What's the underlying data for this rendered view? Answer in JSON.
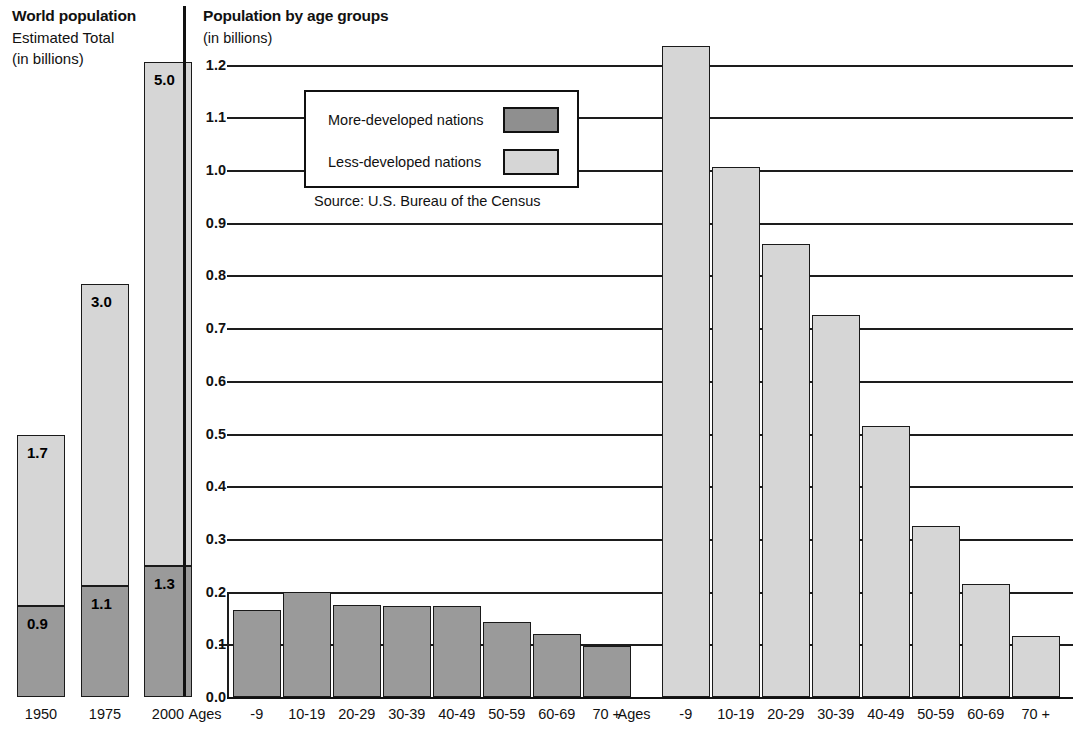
{
  "left": {
    "title": "World population",
    "subtitle_line1": "Estimated Total",
    "subtitle_line2": "(in billions)",
    "categories": [
      "1950",
      "1975",
      "2000"
    ],
    "segments": [
      {
        "year": "1950",
        "more_developed": 0.9,
        "less_developed": 1.7,
        "more_label": "0.9",
        "less_label": "1.7"
      },
      {
        "year": "1975",
        "more_developed": 1.1,
        "less_developed": 3.0,
        "more_label": "1.1",
        "less_label": "3.0"
      },
      {
        "year": "2000",
        "more_developed": 1.3,
        "less_developed": 5.0,
        "more_label": "1.3",
        "less_label": "5.0"
      }
    ]
  },
  "right": {
    "title": "Population by age groups",
    "subtitle": "(in billions)",
    "ages_label": "Ages",
    "legend": {
      "more_developed": "More-developed nations",
      "less_developed": "Less-developed nations"
    },
    "source": "Source: U.S. Bureau of the Census",
    "yticks": [
      "0.0",
      "0.1",
      "0.2",
      "0.3",
      "0.4",
      "0.5",
      "0.6",
      "0.7",
      "0.8",
      "0.9",
      "1.0",
      "1.1",
      "1.2"
    ],
    "age_groups": [
      "-9",
      "10-19",
      "20-29",
      "30-39",
      "40-49",
      "50-59",
      "60-69",
      "70 +"
    ]
  },
  "colors": {
    "more_developed": "#9a9a9a",
    "less_developed": "#d6d6d6",
    "outline": "#1a1a1a",
    "background": "#ffffff"
  },
  "chart_data": {
    "type": "bar",
    "title": "Population by age groups",
    "subtitle": "(in billions)",
    "xlabel": "Ages",
    "ylabel": "(in billions)",
    "ylim": [
      0.0,
      1.2
    ],
    "ytick_step": 0.1,
    "grid": true,
    "legend_position": "inside-upper-left",
    "categories": [
      "-9",
      "10-19",
      "20-29",
      "30-39",
      "40-49",
      "50-59",
      "60-69",
      "70 +"
    ],
    "series": [
      {
        "name": "More-developed nations",
        "color": "#9a9a9a",
        "values": [
          0.165,
          0.2,
          0.175,
          0.173,
          0.172,
          0.142,
          0.12,
          0.097
        ]
      },
      {
        "name": "Less-developed nations",
        "color": "#d6d6d6",
        "values": [
          1.235,
          1.005,
          0.86,
          0.725,
          0.515,
          0.325,
          0.215,
          0.115
        ]
      }
    ],
    "annotations": [
      "Source: U.S. Bureau of the Census"
    ],
    "secondary_chart": {
      "type": "stacked-bar",
      "title": "World population",
      "subtitle": "Estimated Total (in billions)",
      "categories": [
        "1950",
        "1975",
        "2000"
      ],
      "series": [
        {
          "name": "More-developed nations",
          "color": "#9a9a9a",
          "values": [
            0.9,
            1.1,
            1.3
          ]
        },
        {
          "name": "Less-developed nations",
          "color": "#d6d6d6",
          "values": [
            1.7,
            3.0,
            5.0
          ]
        }
      ],
      "totals": [
        2.6,
        4.1,
        6.3
      ]
    }
  }
}
